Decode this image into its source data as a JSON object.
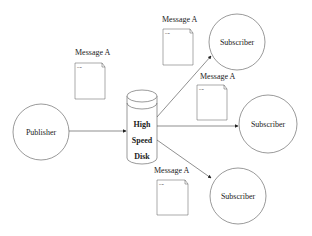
{
  "diagram": {
    "publisher": "Publisher",
    "disk": [
      "High",
      "Speed",
      "Disk"
    ],
    "subscribers": [
      "Subscriber",
      "Subscriber",
      "Subscriber"
    ],
    "messages": [
      {
        "label": "Message A",
        "doc_text": "Item"
      },
      {
        "label": "Message A",
        "doc_text": "Item"
      },
      {
        "label": "Message A",
        "doc_text": "Item"
      },
      {
        "label": "Message A",
        "doc_text": "Item"
      }
    ]
  }
}
